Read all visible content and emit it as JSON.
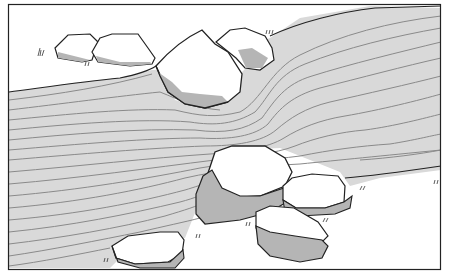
{
  "figure": {
    "colors": {
      "paper": "#ffffff",
      "water": "#d9d9d9",
      "flow_lines": "#8a8a8a",
      "rock_shadow": "#b5b5b5",
      "outline": "#222222"
    },
    "frame": {
      "x": 8,
      "y": 4,
      "width": 433,
      "height": 266
    }
  }
}
